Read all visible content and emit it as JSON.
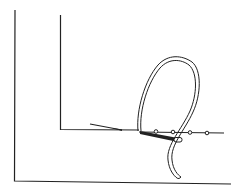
{
  "figure": {
    "colors": {
      "background": "#ffffff",
      "stroke": "#222222"
    },
    "bead_count": 4
  }
}
